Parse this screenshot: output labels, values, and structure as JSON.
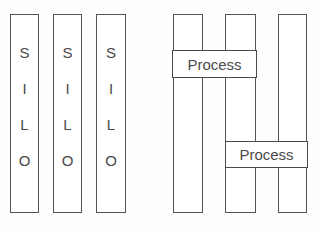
{
  "diagram": {
    "canvas": {
      "width": 322,
      "height": 231,
      "background": "#fdfdfc"
    },
    "colors": {
      "stroke": "#555555",
      "process_stroke": "#4a4a4a",
      "text": "#4a4a4a",
      "fill": "#ffffff"
    },
    "left_group": {
      "name": "silos",
      "bars": [
        {
          "id": "silo-1",
          "letters": [
            "S",
            "I",
            "L",
            "O"
          ],
          "x": 10,
          "y": 14,
          "width": 29,
          "height": 199
        },
        {
          "id": "silo-2",
          "letters": [
            "S",
            "I",
            "L",
            "O"
          ],
          "x": 53,
          "y": 14,
          "width": 29,
          "height": 199
        },
        {
          "id": "silo-3",
          "letters": [
            "S",
            "I",
            "L",
            "O"
          ],
          "x": 96,
          "y": 14,
          "width": 30,
          "height": 199
        }
      ]
    },
    "right_group": {
      "name": "processes",
      "bars": [
        {
          "id": "lane-1",
          "x": 173,
          "y": 14,
          "width": 30,
          "height": 199
        },
        {
          "id": "lane-2",
          "x": 225,
          "y": 14,
          "width": 31,
          "height": 199
        },
        {
          "id": "lane-3",
          "x": 278,
          "y": 14,
          "width": 29,
          "height": 199
        }
      ],
      "process_boxes": [
        {
          "id": "process-1",
          "label": "Process",
          "x": 172,
          "y": 50,
          "width": 85,
          "height": 28
        },
        {
          "id": "process-2",
          "label": "Process",
          "x": 225,
          "y": 141,
          "width": 83,
          "height": 27
        }
      ]
    }
  }
}
